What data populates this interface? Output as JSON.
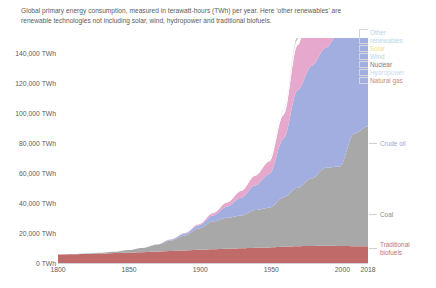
{
  "subtitle": "Global primary energy consumption, measured in terawatt-hours (TWh) per year. Here 'other renewables' are renewable technologies not including solar, wind, hydropower and traditional biofuels.",
  "axis": {
    "y_ticks": [
      "0 TWh",
      "20,000 TWh",
      "40,000 TWh",
      "60,000 TWh",
      "80,000 TWh",
      "100,000 TWh",
      "120,000 TWh",
      "140,000 TWh"
    ],
    "x_ticks": [
      "1800",
      "1850",
      "1900",
      "1950",
      "2000",
      "2018"
    ]
  },
  "legend": [
    {
      "label": "Other renewables",
      "color": "#b9d4e8",
      "two_line": true
    },
    {
      "label": "Solar",
      "color": "#f2e085",
      "two_line": false
    },
    {
      "label": "Wind",
      "color": "#b7d7e4",
      "two_line": false
    },
    {
      "label": "Nuclear",
      "color": "#7a7a7a",
      "two_line": false
    },
    {
      "label": "Hydropower",
      "color": "#c9dcea",
      "two_line": false
    },
    {
      "label": "Natural gas",
      "color": "#c98a8a",
      "two_line": false
    }
  ],
  "annotations": [
    {
      "label": "Crude oil",
      "color": "#9aa7d8"
    },
    {
      "label": "Coal",
      "color": "#8d8d8d"
    },
    {
      "label": "Traditional biofuels",
      "color": "#c07272"
    }
  ],
  "colors": {
    "traditional_biofuels": "#c06a6a",
    "coal": "#a8a8a8",
    "crude_oil": "#a3aee0",
    "natural_gas": "#e6a8cd",
    "hydropower": "#ffffff",
    "nuclear": "#9b6a5a",
    "wind": "#cfe4ef",
    "solar": "#f5e9a0",
    "other_renewables": "#d8e8f2",
    "axis_text": "#5d5d5d",
    "axis_line": "#d4d4d4",
    "background": "#ffffff"
  },
  "chart_data": {
    "type": "area",
    "title": "",
    "subtitle": "Global primary energy consumption, measured in terawatt-hours (TWh) per year. Here 'other renewables' are renewable technologies not including solar, wind, hydropower and traditional biofuels.",
    "xlabel": "",
    "ylabel": "TWh",
    "xlim": [
      1800,
      2018
    ],
    "ylim": [
      0,
      150000
    ],
    "grid": false,
    "legend_position": "right",
    "stacked": true,
    "x": [
      1800,
      1810,
      1820,
      1830,
      1840,
      1850,
      1860,
      1870,
      1880,
      1890,
      1900,
      1910,
      1920,
      1930,
      1940,
      1950,
      1960,
      1970,
      1980,
      1990,
      2000,
      2010,
      2018
    ],
    "series": [
      {
        "name": "Traditional biofuels",
        "color": "#c06a6a",
        "values": [
          5600,
          5800,
          6000,
          6300,
          6600,
          6900,
          7200,
          7600,
          8000,
          8400,
          8800,
          9200,
          9500,
          9800,
          10100,
          10400,
          10800,
          11200,
          11400,
          11500,
          11400,
          11200,
          11100
        ]
      },
      {
        "name": "Coal",
        "color": "#a8a8a8",
        "values": [
          100,
          200,
          300,
          500,
          900,
          1700,
          2800,
          4500,
          7000,
          10000,
          14200,
          18500,
          20600,
          21800,
          25200,
          26400,
          33000,
          39000,
          45000,
          52000,
          53000,
          75000,
          80000
        ]
      },
      {
        "name": "Crude oil",
        "color": "#a3aee0",
        "values": [
          0,
          0,
          0,
          0,
          0,
          0,
          50,
          200,
          600,
          1200,
          2100,
          4000,
          7500,
          12000,
          16500,
          22500,
          39000,
          65000,
          75000,
          80000,
          90000,
          98000,
          100000
        ]
      },
      {
        "name": "Natural gas",
        "color": "#e6a8cd",
        "values": [
          0,
          0,
          0,
          0,
          0,
          0,
          10,
          50,
          150,
          400,
          800,
          1600,
          2800,
          4500,
          6500,
          8500,
          16000,
          30000,
          43000,
          55000,
          65000,
          80000,
          90000
        ]
      },
      {
        "name": "Hydropower",
        "color": "#ffffff",
        "values": [
          0,
          0,
          0,
          0,
          0,
          0,
          0,
          0,
          0,
          50,
          150,
          400,
          700,
          1200,
          1700,
          2200,
          3200,
          4500,
          5800,
          7000,
          8000,
          9500,
          10500
        ]
      },
      {
        "name": "Nuclear",
        "color": "#9b6a5a",
        "values": [
          0,
          0,
          0,
          0,
          0,
          0,
          0,
          0,
          0,
          0,
          0,
          0,
          0,
          0,
          0,
          0,
          100,
          900,
          4000,
          7000,
          8000,
          8000,
          7000
        ]
      },
      {
        "name": "Wind",
        "color": "#cfe4ef",
        "values": [
          0,
          0,
          0,
          0,
          0,
          0,
          0,
          0,
          0,
          0,
          0,
          0,
          0,
          0,
          0,
          0,
          0,
          0,
          0,
          10,
          100,
          900,
          3500
        ]
      },
      {
        "name": "Solar",
        "color": "#f5e9a0",
        "values": [
          0,
          0,
          0,
          0,
          0,
          0,
          0,
          0,
          0,
          0,
          0,
          0,
          0,
          0,
          0,
          0,
          0,
          0,
          0,
          0,
          10,
          200,
          1800
        ]
      },
      {
        "name": "Other renewables",
        "color": "#d8e8f2",
        "values": [
          0,
          0,
          0,
          0,
          0,
          0,
          0,
          0,
          0,
          0,
          0,
          0,
          0,
          0,
          0,
          0,
          20,
          80,
          200,
          400,
          700,
          1400,
          2200
        ]
      }
    ],
    "total_2018_twh": 146000
  }
}
